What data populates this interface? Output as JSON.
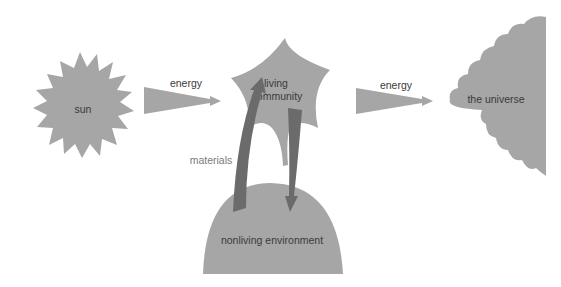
{
  "diagram": {
    "type": "ecosystem energy and material flow",
    "nodes": {
      "sun": {
        "label": "sun"
      },
      "living_community": {
        "label_line1": "living",
        "label_line2": "community"
      },
      "universe": {
        "label": "the universe"
      },
      "nonliving_environment": {
        "label": "nonliving environment"
      }
    },
    "flows": {
      "energy_in": {
        "label": "energy",
        "from": "sun",
        "to": "living community"
      },
      "energy_out": {
        "label": "energy",
        "from": "living community",
        "to": "the universe"
      },
      "materials": {
        "label": "materials",
        "between": [
          "living community",
          "nonliving environment"
        ]
      }
    },
    "colors": {
      "shape_fill": "#a6a6a6",
      "arrow_dark": "#6b6b6b",
      "text": "#3a3a3a",
      "text_light": "#7a7a7a",
      "background": "#ffffff"
    }
  }
}
